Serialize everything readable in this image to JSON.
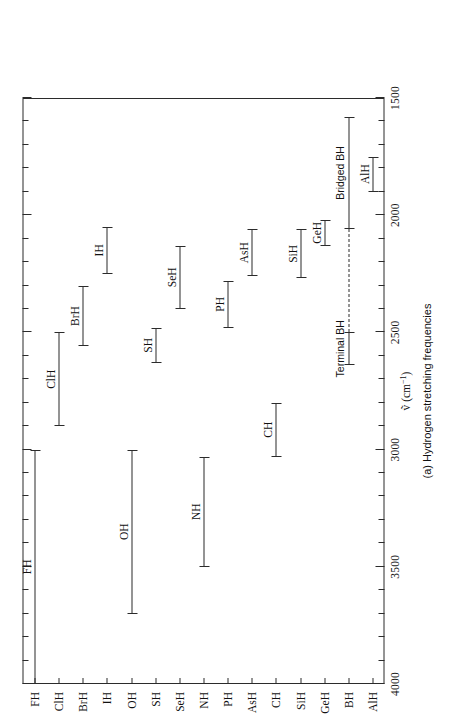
{
  "figure": {
    "caption": "(a) Hydrogen stretching frequencies",
    "axis_title": "ṽ (cm",
    "axis_title_sup": "−1",
    "axis_title_tail": ")"
  },
  "chart_data": {
    "type": "bar",
    "orientation": "horizontal-range",
    "title": "(a) Hydrogen stretching frequencies",
    "xlabel": "ṽ (cm⁻¹)",
    "ylabel": "",
    "xlim": [
      4000,
      1500
    ],
    "x_reversed": true,
    "grid": false,
    "legend": "none",
    "xticks": [
      4000,
      3500,
      3000,
      2500,
      2000,
      1500
    ],
    "xtick_labels": [
      "4000",
      "3500",
      "3000",
      "2500",
      "2000",
      "1500"
    ],
    "minor_tick_interval": 100,
    "categories": [
      "FH",
      "ClH",
      "BrH",
      "IH",
      "OH",
      "SH",
      "SeH",
      "NH",
      "PH",
      "AsH",
      "CH",
      "SiH",
      "GeH",
      "BH",
      "AlH"
    ],
    "ranges": [
      {
        "label": "FH",
        "low": 4000,
        "high": 3000,
        "style": "solid"
      },
      {
        "label": "ClH",
        "low": 2900,
        "high": 2500,
        "style": "solid"
      },
      {
        "label": "BrH",
        "low": 2560,
        "high": 2300,
        "style": "solid"
      },
      {
        "label": "IH",
        "low": 2250,
        "high": 2050,
        "style": "solid"
      },
      {
        "label": "OH",
        "low": 3700,
        "high": 3000,
        "style": "solid"
      },
      {
        "label": "SH",
        "low": 2630,
        "high": 2480,
        "style": "solid"
      },
      {
        "label": "SeH",
        "low": 2400,
        "high": 2130,
        "style": "solid"
      },
      {
        "label": "NH",
        "low": 3500,
        "high": 3030,
        "style": "solid"
      },
      {
        "label": "PH",
        "low": 2480,
        "high": 2280,
        "style": "solid"
      },
      {
        "label": "AsH",
        "low": 2260,
        "high": 2060,
        "style": "solid"
      },
      {
        "label": "CH",
        "low": 3030,
        "high": 2800,
        "style": "solid"
      },
      {
        "label": "SiH",
        "low": 2270,
        "high": 2060,
        "style": "solid"
      },
      {
        "label": "GeH",
        "low": 2130,
        "high": 2020,
        "style": "solid"
      },
      {
        "label": "BH",
        "low": 2640,
        "high": 2500,
        "style": "solid",
        "annotation": "Terminal BH"
      },
      {
        "label": "BH",
        "low": 2500,
        "high": 2060,
        "style": "dashed",
        "annotation": ""
      },
      {
        "label": "BH",
        "low": 2060,
        "high": 1580,
        "style": "solid",
        "annotation": "Bridged BH"
      },
      {
        "label": "AlH",
        "low": 1900,
        "high": 1750,
        "style": "solid"
      }
    ],
    "annotations": [
      "Terminal BH",
      "Bridged BH"
    ]
  },
  "series_labels": {
    "FH": "FH",
    "ClH": "ClH",
    "BrH": "BrH",
    "IH": "IH",
    "OH": "OH",
    "SH": "SH",
    "SeH": "SeH",
    "NH": "NH",
    "PH": "PH",
    "AsH": "AsH",
    "CH": "CH",
    "SiH": "SiH",
    "GeH": "GeH",
    "BH_terminal": "Terminal BH",
    "BH_bridged": "Bridged BH",
    "AlH": "AlH"
  },
  "colors": {
    "ink": "#2b2b2b",
    "background": "#ffffff"
  }
}
